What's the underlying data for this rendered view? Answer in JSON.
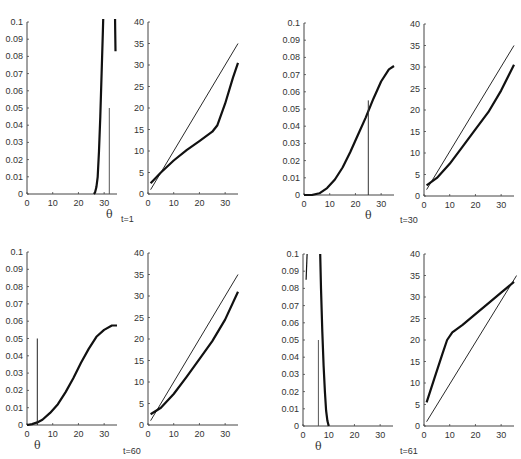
{
  "figure": {
    "time_labels": [
      {
        "id": "t1",
        "text": "t=1",
        "x": 121,
        "y": 214
      },
      {
        "id": "t30",
        "text": "t=30",
        "x": 400,
        "y": 215
      },
      {
        "id": "t60",
        "text": "t=60",
        "x": 123,
        "y": 446
      },
      {
        "id": "t61",
        "text": "t=61",
        "x": 400,
        "y": 446
      }
    ]
  },
  "chart_data": [
    {
      "id": "t1-density",
      "type": "line",
      "title": "",
      "time": "t=1",
      "xlabel": "θ",
      "ylabel": "",
      "xlim": [
        0,
        35
      ],
      "ylim": [
        0,
        0.1
      ],
      "xticks": [
        0,
        10,
        20,
        30
      ],
      "yticks": [
        0,
        0.01,
        0.02,
        0.03,
        0.04,
        0.05,
        0.06,
        0.07,
        0.08,
        0.09,
        0.1
      ],
      "ytick_labels": [
        "0",
        "0.01",
        "0.02",
        "0.03",
        "0.04",
        "0.05",
        "0.06",
        "0.07",
        "0.08",
        "0.09",
        "0.1"
      ],
      "box": {
        "x0": 27,
        "y0": 194,
        "x1": 117,
        "y1": 22
      },
      "series": [
        {
          "name": "density",
          "width": 2.2,
          "points": [
            [
              26,
              0
            ],
            [
              26.5,
              0.001
            ],
            [
              27,
              0.004
            ],
            [
              27.5,
              0.01
            ],
            [
              28,
              0.025
            ],
            [
              28.5,
              0.045
            ],
            [
              29,
              0.07
            ],
            [
              29.5,
              0.095
            ],
            [
              29.8,
              0.11
            ]
          ]
        },
        {
          "name": "density-right",
          "width": 2.2,
          "points": [
            [
              34.2,
              0.11
            ],
            [
              34.3,
              0.095
            ],
            [
              34.4,
              0.083
            ]
          ]
        },
        {
          "name": "true-theta",
          "width": 1,
          "color": "#555",
          "points": [
            [
              32,
              0
            ],
            [
              32,
              0.05
            ]
          ]
        }
      ]
    },
    {
      "id": "t1-comparison",
      "type": "line",
      "title": "",
      "time": "t=1",
      "xlabel": "",
      "ylabel": "",
      "xlim": [
        0,
        35
      ],
      "ylim": [
        0,
        40
      ],
      "xticks": [
        0,
        10,
        20,
        30
      ],
      "yticks": [
        0,
        5,
        10,
        15,
        20,
        25,
        30,
        35,
        40
      ],
      "ytick_labels": [
        "0",
        "5",
        "10",
        "15",
        "20",
        "25",
        "30",
        "35",
        "40"
      ],
      "box": {
        "x0": 148,
        "y0": 194,
        "x1": 238,
        "y1": 22
      },
      "series": [
        {
          "name": "identity",
          "width": 0.9,
          "points": [
            [
              1,
              1
            ],
            [
              35,
              35
            ]
          ]
        },
        {
          "name": "estimate",
          "width": 2.2,
          "points": [
            [
              1,
              2.5
            ],
            [
              5,
              5
            ],
            [
              10,
              7.8
            ],
            [
              15,
              10.2
            ],
            [
              20,
              12.3
            ],
            [
              25,
              14.5
            ],
            [
              27,
              16
            ],
            [
              30,
              21
            ],
            [
              33,
              27
            ],
            [
              35,
              30.5
            ]
          ]
        }
      ]
    },
    {
      "id": "t30-density",
      "type": "line",
      "title": "",
      "time": "t=30",
      "xlabel": "θ",
      "ylabel": "",
      "xlim": [
        0,
        35
      ],
      "ylim": [
        0,
        0.1
      ],
      "xticks": [
        0,
        10,
        20,
        30
      ],
      "yticks": [
        0,
        0.01,
        0.02,
        0.03,
        0.04,
        0.05,
        0.06,
        0.07,
        0.08,
        0.09,
        0.1
      ],
      "ytick_labels": [
        "0",
        "0.01",
        "0.02",
        "0.03",
        "0.04",
        "0.05",
        "0.06",
        "0.07",
        "0.08",
        "0.09",
        "0.1"
      ],
      "box": {
        "x0": 304,
        "y0": 195,
        "x1": 394,
        "y1": 23
      },
      "series": [
        {
          "name": "density",
          "width": 2.2,
          "points": [
            [
              0,
              0
            ],
            [
              3,
              0
            ],
            [
              6,
              0.001
            ],
            [
              9,
              0.004
            ],
            [
              12,
              0.009
            ],
            [
              15,
              0.016
            ],
            [
              18,
              0.025
            ],
            [
              21,
              0.035
            ],
            [
              24,
              0.045
            ],
            [
              27,
              0.056
            ],
            [
              30,
              0.066
            ],
            [
              33,
              0.073
            ],
            [
              35,
              0.075
            ]
          ]
        },
        {
          "name": "true-theta",
          "width": 1,
          "color": "#333",
          "points": [
            [
              25,
              0
            ],
            [
              25,
              0.055
            ]
          ]
        }
      ]
    },
    {
      "id": "t30-comparison",
      "type": "line",
      "title": "",
      "time": "t=30",
      "xlabel": "",
      "ylabel": "",
      "xlim": [
        0,
        35
      ],
      "ylim": [
        0,
        40
      ],
      "xticks": [
        0,
        10,
        20,
        30
      ],
      "yticks": [
        0,
        5,
        10,
        15,
        20,
        25,
        30,
        35,
        40
      ],
      "ytick_labels": [
        "0",
        "5",
        "10",
        "15",
        "20",
        "25",
        "30",
        "35",
        "40"
      ],
      "box": {
        "x0": 424,
        "y0": 196,
        "x1": 514,
        "y1": 24
      },
      "series": [
        {
          "name": "identity",
          "width": 0.9,
          "points": [
            [
              1,
              1.5
            ],
            [
              35,
              35
            ]
          ]
        },
        {
          "name": "estimate",
          "width": 2.2,
          "points": [
            [
              1,
              2.5
            ],
            [
              5,
              4.2
            ],
            [
              10,
              7.5
            ],
            [
              15,
              11.5
            ],
            [
              20,
              15.5
            ],
            [
              25,
              19.5
            ],
            [
              30,
              24.5
            ],
            [
              35,
              30.5
            ]
          ]
        }
      ]
    },
    {
      "id": "t60-density",
      "type": "line",
      "title": "",
      "time": "t=60",
      "xlabel": "θ",
      "ylabel": "",
      "xlim": [
        0,
        35
      ],
      "ylim": [
        0,
        0.1
      ],
      "xticks": [
        0,
        10,
        20,
        30
      ],
      "yticks": [
        0,
        0.01,
        0.02,
        0.03,
        0.04,
        0.05,
        0.06,
        0.07,
        0.08,
        0.09,
        0.1
      ],
      "ytick_labels": [
        "0",
        "0.01",
        "0.02",
        "0.03",
        "0.04",
        "0.05",
        "0.06",
        "0.07",
        "0.08",
        "0.09",
        "0.1"
      ],
      "box": {
        "x0": 27,
        "y0": 425,
        "x1": 117,
        "y1": 252
      },
      "series": [
        {
          "name": "density",
          "width": 2.2,
          "points": [
            [
              0,
              0
            ],
            [
              2,
              0.0005
            ],
            [
              4,
              0.0015
            ],
            [
              6,
              0.003
            ],
            [
              9,
              0.007
            ],
            [
              12,
              0.012
            ],
            [
              15,
              0.019
            ],
            [
              18,
              0.027
            ],
            [
              21,
              0.036
            ],
            [
              24,
              0.044
            ],
            [
              27,
              0.051
            ],
            [
              30,
              0.055
            ],
            [
              33,
              0.0575
            ],
            [
              35,
              0.0575
            ]
          ]
        },
        {
          "name": "true-theta",
          "width": 1,
          "color": "#222",
          "points": [
            [
              4,
              0
            ],
            [
              4,
              0.05
            ]
          ]
        }
      ]
    },
    {
      "id": "t60-comparison",
      "type": "line",
      "title": "",
      "time": "t=60",
      "xlabel": "",
      "ylabel": "",
      "xlim": [
        0,
        35
      ],
      "ylim": [
        0,
        40
      ],
      "xticks": [
        0,
        10,
        20,
        30
      ],
      "yticks": [
        0,
        5,
        10,
        15,
        20,
        25,
        30,
        35,
        40
      ],
      "ytick_labels": [
        "0",
        "5",
        "10",
        "15",
        "20",
        "25",
        "30",
        "35",
        "40"
      ],
      "box": {
        "x0": 148,
        "y0": 425,
        "x1": 238,
        "y1": 253
      },
      "series": [
        {
          "name": "identity",
          "width": 0.9,
          "points": [
            [
              1,
              1
            ],
            [
              35,
              35
            ]
          ]
        },
        {
          "name": "estimate",
          "width": 2.2,
          "points": [
            [
              1,
              2.5
            ],
            [
              5,
              4
            ],
            [
              10,
              7.2
            ],
            [
              15,
              11.2
            ],
            [
              20,
              15.3
            ],
            [
              25,
              19.5
            ],
            [
              30,
              24.5
            ],
            [
              35,
              31
            ]
          ]
        }
      ]
    },
    {
      "id": "t61-density",
      "type": "line",
      "title": "",
      "time": "t=61",
      "xlabel": "θ",
      "ylabel": "",
      "xlim": [
        0,
        35
      ],
      "ylim": [
        0,
        0.1
      ],
      "xticks": [
        0,
        10,
        20,
        30
      ],
      "yticks": [
        0,
        0.01,
        0.02,
        0.03,
        0.04,
        0.05,
        0.06,
        0.07,
        0.08,
        0.09,
        0.1
      ],
      "ytick_labels": [
        "0",
        "0.01",
        "0.02",
        "0.03",
        "0.04",
        "0.05",
        "0.06",
        "0.07",
        "0.08",
        "0.09",
        "0.1"
      ],
      "box": {
        "x0": 303,
        "y0": 426,
        "x1": 393,
        "y1": 254
      },
      "series": [
        {
          "name": "density-left",
          "width": 1.2,
          "points": [
            [
              1.2,
              0.085
            ],
            [
              1.6,
              0.1
            ]
          ]
        },
        {
          "name": "density",
          "width": 2.2,
          "points": [
            [
              6.7,
              0.1
            ],
            [
              7,
              0.08
            ],
            [
              7.5,
              0.055
            ],
            [
              8,
              0.035
            ],
            [
              8.5,
              0.02
            ],
            [
              9,
              0.009
            ],
            [
              9.5,
              0.003
            ],
            [
              10,
              0
            ]
          ]
        },
        {
          "name": "true-theta",
          "width": 1,
          "color": "#555",
          "points": [
            [
              6,
              0
            ],
            [
              6,
              0.05
            ]
          ]
        }
      ]
    },
    {
      "id": "t61-comparison",
      "type": "line",
      "title": "",
      "time": "t=61",
      "xlabel": "",
      "ylabel": "",
      "xlim": [
        0,
        35
      ],
      "ylim": [
        0,
        40
      ],
      "xticks": [
        0,
        10,
        20,
        30
      ],
      "yticks": [
        0,
        5,
        10,
        15,
        20,
        25,
        30,
        35,
        40
      ],
      "ytick_labels": [
        "0",
        "5",
        "10",
        "15",
        "20",
        "25",
        "30",
        "35",
        "40"
      ],
      "box": {
        "x0": 424,
        "y0": 426,
        "x1": 514,
        "y1": 254
      },
      "series": [
        {
          "name": "identity",
          "width": 0.9,
          "points": [
            [
              1,
              1
            ],
            [
              36,
              35
            ]
          ]
        },
        {
          "name": "estimate",
          "width": 2.2,
          "points": [
            [
              1,
              5.5
            ],
            [
              4,
              11
            ],
            [
              7,
              16.5
            ],
            [
              9,
              20
            ],
            [
              11,
              21.8
            ],
            [
              15,
              23.5
            ],
            [
              20,
              26
            ],
            [
              25,
              28.5
            ],
            [
              30,
              31
            ],
            [
              35,
              33.5
            ]
          ]
        }
      ]
    }
  ]
}
